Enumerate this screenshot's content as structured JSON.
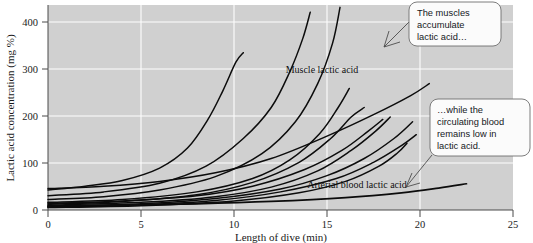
{
  "chart_data": {
    "type": "line",
    "title": "",
    "xlabel": "Length of dive (min)",
    "ylabel": "Lactic acid concentration (mg %)",
    "xlim": [
      0,
      25
    ],
    "ylim": [
      0,
      430
    ],
    "xticks": [
      0,
      5,
      10,
      15,
      20,
      25
    ],
    "yticks": [
      0,
      100,
      200,
      300,
      400
    ],
    "grid": true,
    "legend_position": "inline-annotations",
    "background": "#d0d0d0",
    "gridline_color": "#fdfdfd",
    "line_color": "#0c0c0c",
    "annotations": [
      {
        "name": "muscle-lactic-acid-label",
        "text": "Muscle lactic acid",
        "x": 11.8,
        "y": 312
      },
      {
        "name": "arterial-blood-lactic-acid-label",
        "text": "Arterial blood lactic acid",
        "x": 13.2,
        "y": 62
      }
    ],
    "callouts": [
      {
        "name": "callout-muscles",
        "text": "The muscles accumulate lactic acid…",
        "lines": [
          "The muscles",
          "accumulate",
          "lactic acid…"
        ],
        "points_to_x": 10.4,
        "points_to_y": 400
      },
      {
        "name": "callout-blood",
        "text": "…while the circulating blood remains low in lactic acid.",
        "lines": [
          "…while the",
          "circulating blood",
          "remains low in",
          "lactic acid."
        ],
        "points_to_x": 13.9,
        "points_to_y": 42
      }
    ],
    "series": [
      {
        "name": "Muscle lactic acid curve 1",
        "group": "muscle",
        "points": [
          [
            0,
            42
          ],
          [
            2,
            50
          ],
          [
            4,
            62
          ],
          [
            6,
            88
          ],
          [
            7.5,
            130
          ],
          [
            8.6,
            190
          ],
          [
            9.4,
            250
          ],
          [
            10.1,
            310
          ],
          [
            10.5,
            330
          ]
        ]
      },
      {
        "name": "Muscle lactic acid curve 2",
        "group": "muscle",
        "points": [
          [
            0,
            30
          ],
          [
            3,
            38
          ],
          [
            6,
            56
          ],
          [
            8.5,
            92
          ],
          [
            10.5,
            150
          ],
          [
            12,
            215
          ],
          [
            13,
            290
          ],
          [
            13.7,
            360
          ],
          [
            14.1,
            415
          ]
        ]
      },
      {
        "name": "Muscle lactic acid curve 3",
        "group": "muscle",
        "points": [
          [
            0,
            22
          ],
          [
            3,
            28
          ],
          [
            6,
            42
          ],
          [
            9,
            70
          ],
          [
            11.5,
            118
          ],
          [
            13.3,
            185
          ],
          [
            14.5,
            265
          ],
          [
            15.3,
            350
          ],
          [
            15.7,
            425
          ]
        ]
      },
      {
        "name": "Muscle lactic acid curve 4",
        "group": "muscle",
        "points": [
          [
            0,
            16
          ],
          [
            4,
            22
          ],
          [
            8,
            38
          ],
          [
            11,
            66
          ],
          [
            13,
            105
          ],
          [
            14.6,
            160
          ],
          [
            15.6,
            215
          ],
          [
            16.2,
            255
          ]
        ]
      },
      {
        "name": "Muscle lactic acid curve 5",
        "group": "muscle",
        "points": [
          [
            0,
            12
          ],
          [
            4,
            18
          ],
          [
            8,
            32
          ],
          [
            11,
            58
          ],
          [
            13.5,
            100
          ],
          [
            15.2,
            150
          ],
          [
            16.3,
            195
          ],
          [
            17,
            215
          ]
        ]
      },
      {
        "name": "Muscle lactic acid curve 6",
        "group": "muscle",
        "points": [
          [
            0,
            10
          ],
          [
            5,
            16
          ],
          [
            9,
            28
          ],
          [
            12,
            48
          ],
          [
            14.5,
            82
          ],
          [
            16.3,
            125
          ],
          [
            17.6,
            165
          ],
          [
            18.4,
            195
          ]
        ]
      },
      {
        "name": "Muscle lactic acid curve 7",
        "group": "muscle",
        "points": [
          [
            0,
            8
          ],
          [
            5,
            13
          ],
          [
            9,
            24
          ],
          [
            12.5,
            44
          ],
          [
            15,
            72
          ],
          [
            17,
            108
          ],
          [
            18.6,
            150
          ],
          [
            19.6,
            185
          ]
        ]
      },
      {
        "name": "Muscle lactic acid curve 8",
        "group": "muscle",
        "points": [
          [
            0,
            45
          ],
          [
            3,
            50
          ],
          [
            6,
            60
          ],
          [
            9,
            78
          ],
          [
            12,
            108
          ],
          [
            15,
            155
          ],
          [
            17.5,
            200
          ],
          [
            19.5,
            240
          ],
          [
            20.5,
            265
          ]
        ]
      },
      {
        "name": "Muscle lactic acid curve 9",
        "group": "muscle",
        "points": [
          [
            0,
            6
          ],
          [
            5,
            11
          ],
          [
            9,
            20
          ],
          [
            12.5,
            38
          ],
          [
            15.5,
            66
          ],
          [
            17.5,
            100
          ],
          [
            19,
            135
          ],
          [
            19.8,
            158
          ]
        ]
      },
      {
        "name": "Muscle lactic acid curve 10",
        "group": "muscle",
        "points": [
          [
            0,
            5
          ],
          [
            5,
            9
          ],
          [
            10,
            19
          ],
          [
            13.5,
            36
          ],
          [
            16,
            60
          ],
          [
            17.8,
            92
          ],
          [
            18.8,
            120
          ],
          [
            19.3,
            140
          ]
        ]
      },
      {
        "name": "Muscle lactic acid curve 11",
        "group": "muscle",
        "points": [
          [
            0,
            14
          ],
          [
            4,
            19
          ],
          [
            8,
            30
          ],
          [
            11,
            50
          ],
          [
            13.8,
            85
          ],
          [
            15.8,
            125
          ],
          [
            17.2,
            165
          ],
          [
            18,
            190
          ]
        ]
      },
      {
        "name": "Arterial blood lactic acid",
        "group": "blood",
        "points": [
          [
            0,
            8
          ],
          [
            4,
            10
          ],
          [
            8,
            13
          ],
          [
            12,
            18
          ],
          [
            16,
            26
          ],
          [
            19,
            36
          ],
          [
            21,
            46
          ],
          [
            22.5,
            55
          ]
        ]
      }
    ]
  }
}
